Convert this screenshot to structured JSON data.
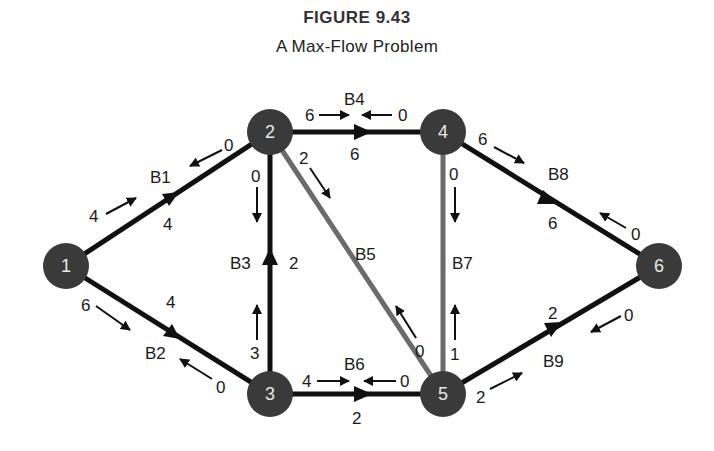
{
  "figure": {
    "number": "FIGURE 9.43",
    "title": "A Max-Flow Problem"
  },
  "colors": {
    "node_fill": "#3a3a3a",
    "node_text": "#e8e8e8",
    "edge_dark": "#111111",
    "edge_gray": "#6b6b6b",
    "text": "#1a1a1a"
  },
  "nodes": [
    {
      "id": "1",
      "label": "1"
    },
    {
      "id": "2",
      "label": "2"
    },
    {
      "id": "3",
      "label": "3"
    },
    {
      "id": "4",
      "label": "4"
    },
    {
      "id": "5",
      "label": "5"
    },
    {
      "id": "6",
      "label": "6"
    }
  ],
  "edges": {
    "B1": {
      "name": "B1",
      "from": "1",
      "to": "2",
      "flow": "4",
      "cap_forward": "4",
      "cap_backward": "0"
    },
    "B2": {
      "name": "B2",
      "from": "1",
      "to": "3",
      "flow": "4",
      "cap_forward": "6",
      "cap_backward": "0"
    },
    "B3": {
      "name": "B3",
      "from": "3",
      "to": "2",
      "flow": "2",
      "cap_forward": "3",
      "cap_backward": "0"
    },
    "B4": {
      "name": "B4",
      "from": "2",
      "to": "4",
      "flow": "6",
      "cap_forward": "6",
      "cap_backward": "0"
    },
    "B5": {
      "name": "B5",
      "from": "2",
      "to": "5",
      "flow": "",
      "cap_forward": "2",
      "cap_backward": "0"
    },
    "B6": {
      "name": "B6",
      "from": "3",
      "to": "5",
      "flow": "2",
      "cap_forward": "4",
      "cap_backward": "0"
    },
    "B7": {
      "name": "B7",
      "from": "4",
      "to": "5",
      "flow": "",
      "cap_forward": "0",
      "cap_backward": "1"
    },
    "B8": {
      "name": "B8",
      "from": "4",
      "to": "6",
      "flow": "6",
      "cap_forward": "6",
      "cap_backward": "0"
    },
    "B9": {
      "name": "B9",
      "from": "5",
      "to": "6",
      "flow": "2",
      "cap_forward": "2",
      "cap_backward": "0"
    }
  }
}
